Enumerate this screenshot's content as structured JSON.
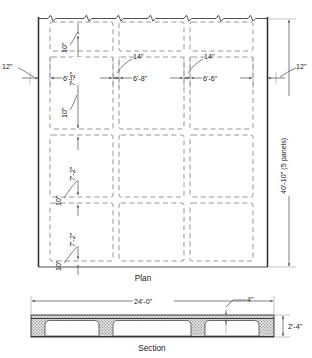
{
  "figure": {
    "title_plan": "Plan",
    "title_section": "Section"
  },
  "plan": {
    "horizontal_dimensions": [
      {
        "id": "edge-left",
        "label": "12\""
      },
      {
        "id": "bay-1",
        "label": "6'-6\""
      },
      {
        "id": "rib-1",
        "label": "14\""
      },
      {
        "id": "bay-2",
        "label": "6'-8\""
      },
      {
        "id": "rib-2",
        "label": "14\""
      },
      {
        "id": "bay-3",
        "label": "6'-6\""
      },
      {
        "id": "edge-right",
        "label": "12\""
      }
    ],
    "vertical_dimensions": [
      {
        "id": "rib-top",
        "label": "10\""
      },
      {
        "id": "panel-1",
        "label": "7'-2\""
      },
      {
        "id": "rib-a",
        "label": "10\""
      },
      {
        "id": "panel-2",
        "label": "7'-2\""
      },
      {
        "id": "rib-b",
        "label": "10\""
      },
      {
        "id": "panel-3",
        "label": "7'-2\""
      },
      {
        "id": "rib-c",
        "label": "10\""
      }
    ],
    "overall_height": "40'-10\" (5 panels)"
  },
  "section": {
    "overall_width": "24'-0\"",
    "overall_depth": "2'-4\"",
    "slab_thickness": "4\""
  },
  "colors": {
    "ink": "#2b2b2b",
    "dim_ink": "#4a4a4a",
    "hidden": "#8a8a8a",
    "hatch": "#a9a9a9",
    "paper": "#ffffff"
  }
}
